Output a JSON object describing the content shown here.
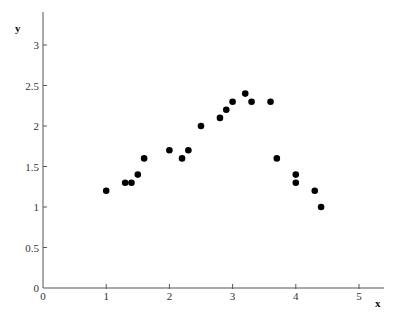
{
  "chart_data": {
    "type": "scatter",
    "title": "",
    "xlabel": "x",
    "ylabel": "y",
    "xlim": [
      0,
      5.4
    ],
    "ylim": [
      0,
      3.4
    ],
    "grid": false,
    "legend": null,
    "x_ticks": [
      0,
      1,
      2,
      3,
      4,
      5
    ],
    "x_tick_labels": [
      "0",
      "1",
      "2",
      "3",
      "4",
      "5"
    ],
    "y_ticks": [
      0,
      0.5,
      1,
      1.5,
      2,
      2.5,
      3
    ],
    "y_tick_labels": [
      "0",
      "0.5",
      "1",
      "1.5",
      "2",
      "2.5",
      "3"
    ],
    "marker_color": "#000000",
    "series": [
      {
        "name": "data",
        "points": [
          {
            "x": 1.0,
            "y": 1.2
          },
          {
            "x": 1.3,
            "y": 1.3
          },
          {
            "x": 1.4,
            "y": 1.3
          },
          {
            "x": 1.5,
            "y": 1.4
          },
          {
            "x": 1.6,
            "y": 1.6
          },
          {
            "x": 2.0,
            "y": 1.7
          },
          {
            "x": 2.2,
            "y": 1.6
          },
          {
            "x": 2.3,
            "y": 1.7
          },
          {
            "x": 2.5,
            "y": 2.0
          },
          {
            "x": 2.8,
            "y": 2.1
          },
          {
            "x": 2.9,
            "y": 2.2
          },
          {
            "x": 3.0,
            "y": 2.3
          },
          {
            "x": 3.2,
            "y": 2.4
          },
          {
            "x": 3.3,
            "y": 2.3
          },
          {
            "x": 3.6,
            "y": 2.3
          },
          {
            "x": 3.7,
            "y": 1.6
          },
          {
            "x": 4.0,
            "y": 1.4
          },
          {
            "x": 4.0,
            "y": 1.3
          },
          {
            "x": 4.3,
            "y": 1.2
          },
          {
            "x": 4.4,
            "y": 1.0
          }
        ]
      }
    ]
  }
}
